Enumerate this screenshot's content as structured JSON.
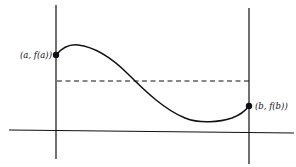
{
  "figure": {
    "type": "mean-value-theorem-illustration",
    "labels": {
      "left_point": "(a, f(a))",
      "right_point": "(b, f(b))"
    },
    "colors": {
      "ink": "#111111",
      "background": "#ffffff"
    },
    "elements": {
      "x_axis": {
        "x1": 9,
        "y1": 130,
        "x2": 294,
        "y2": 133
      },
      "left_vertical": {
        "x": 56,
        "y1": 5,
        "y2": 159
      },
      "right_vertical": {
        "x": 249,
        "y1": 8,
        "y2": 164
      },
      "dashed_line": {
        "y": 81,
        "x1": 56,
        "x2": 249
      },
      "left_point": {
        "x": 56,
        "y": 55
      },
      "right_point": {
        "x": 249,
        "y": 106
      },
      "curve_peak": {
        "x": 75,
        "y": 45
      },
      "curve_min": {
        "x": 215,
        "y": 121
      }
    }
  }
}
